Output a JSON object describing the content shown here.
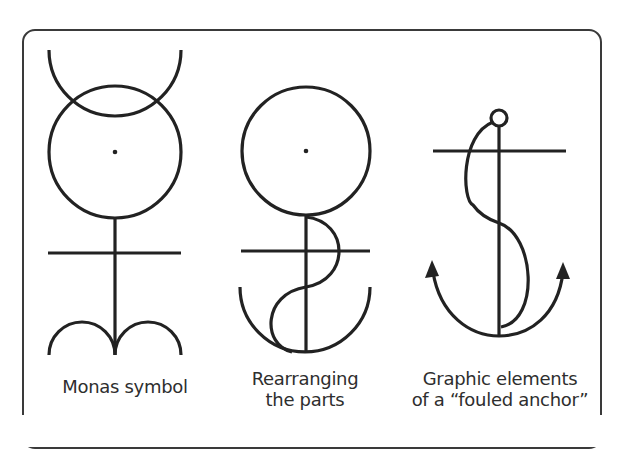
{
  "figure": {
    "panels": [
      {
        "id": "monas",
        "caption_lines": [
          "Monas symbol"
        ],
        "elements": [
          "top-crescent-arc",
          "circle",
          "center-dot",
          "vertical-stem",
          "crossbar",
          "double-arc-base"
        ]
      },
      {
        "id": "rearranging",
        "caption_lines": [
          "Rearranging",
          "the parts"
        ],
        "elements": [
          "circle",
          "center-dot",
          "vertical-stem",
          "crossbar",
          "s-curve",
          "bowl-arc"
        ]
      },
      {
        "id": "fouled-anchor",
        "caption_lines": [
          "Graphic elements",
          "of a “fouled anchor”"
        ],
        "elements": [
          "ring",
          "shank",
          "stock-crossbar",
          "rope-s-curve",
          "arms-arc",
          "left-arrowhead",
          "right-arrowhead"
        ]
      }
    ],
    "colors": {
      "stroke": "#222222",
      "frame": "#3a3a3a",
      "text": "#2e2e2e",
      "background": "#ffffff"
    }
  }
}
